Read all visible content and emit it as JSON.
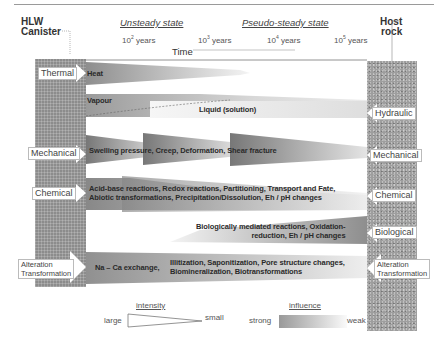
{
  "header": {
    "left_label_line1": "HLW",
    "left_label_line2": "Canister",
    "right_label_line1": "Host",
    "right_label_line2": "rock",
    "unsteady_state": "Unsteady  state",
    "pseudo_steady_state": "Pseudo-steady state",
    "time_label": "Time"
  },
  "time_axis": [
    {
      "base": "10",
      "exp": "2",
      "unit": " years"
    },
    {
      "base": "10",
      "exp": "3",
      "unit": " years"
    },
    {
      "base": "10",
      "exp": "4",
      "unit": " years"
    },
    {
      "base": "10",
      "exp": "5",
      "unit": " years"
    }
  ],
  "left_processes": {
    "thermal": "Thermal",
    "mechanical": "Mechanical",
    "chemical": "Chemical",
    "alteration_line1": "Alteration",
    "alteration_line2": "Transformation"
  },
  "right_processes": {
    "hydraulic": "Hydraulic",
    "mechanical": "Mechanical",
    "chemical": "Chemical",
    "biological": "Biological",
    "alteration_line1": "Alteration",
    "alteration_line2": "Transformation"
  },
  "bands": {
    "heat": "Heat",
    "vapour": "Vapour",
    "liquid": "Liquid (solution)",
    "mechanical": "Swelling pressure, Creep,  Deformation, Shear fracture",
    "chemical_line1": "Acid-base reactions, Redox reactions, Partitioning, Transport and Fate,",
    "chemical_line2": "Abiotic transformations,  Precipitation/Dissolution, Eh / pH changes",
    "biological_line1": "Biologically mediated reactions, Oxidation-",
    "biological_line2": "reduction, Eh / pH changes",
    "alteration_left": "Na – Ca exchange,",
    "alteration_line1": "Illitization, Saponitization, Pore structure changes,",
    "alteration_line2": "Biomineralization, Biotransformations"
  },
  "legend": {
    "intensity_title": "intensity",
    "intensity_large": "large",
    "intensity_small": "small",
    "influence_title": "influence",
    "influence_strong": "strong",
    "influence_weak": "weak"
  },
  "colors": {
    "canister": "#8c8c8c",
    "host_rock": "#9e9e9e",
    "band_dark": "#8a8a8a",
    "band_light": "#f2f2f2"
  }
}
